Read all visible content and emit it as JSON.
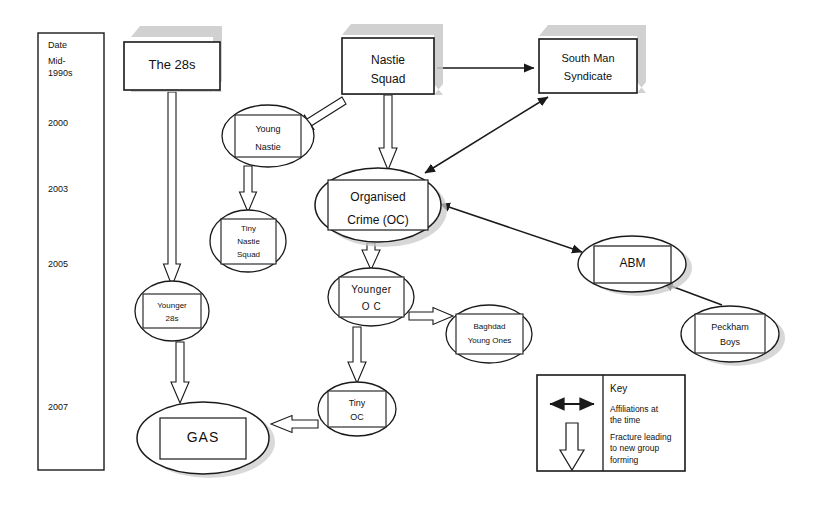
{
  "diagram": {
    "date_axis": {
      "name": "Date",
      "header": "Date",
      "ticks": [
        {
          "label": "Mid-\n1990s",
          "y": 62
        },
        {
          "label": "2000",
          "y": 122
        },
        {
          "label": "2003",
          "y": 188
        },
        {
          "label": "2005",
          "y": 263
        },
        {
          "label": "2007",
          "y": 406
        }
      ]
    },
    "nodes": [
      {
        "id": "the28s",
        "label": "The 28s",
        "shape": "box",
        "shadow": true,
        "cx": 172,
        "cy": 66,
        "w": 96,
        "h": 48,
        "font": 13
      },
      {
        "id": "nastie",
        "label": "Nastie\nSquad",
        "shape": "box",
        "shadow": true,
        "cx": 388,
        "cy": 66,
        "w": 92,
        "h": 56,
        "font": 12
      },
      {
        "id": "southman",
        "label": "South Man\nSyndicate",
        "shape": "box",
        "shadow": true,
        "cx": 588,
        "cy": 66,
        "w": 98,
        "h": 54,
        "font": 11
      },
      {
        "id": "youngnastie",
        "label": "Young\nNastie",
        "shape": "ellipse",
        "shadow": false,
        "cx": 268,
        "cy": 136,
        "w": 92,
        "h": 62,
        "font": 9
      },
      {
        "id": "tinynastie",
        "label": "Tiny\nNastie\nSquad",
        "shape": "ellipse",
        "shadow": false,
        "cx": 248,
        "cy": 241,
        "w": 76,
        "h": 62,
        "font": 8
      },
      {
        "id": "oc",
        "label": "Organised\nCrime (OC)",
        "shape": "ellipse",
        "shadow": true,
        "cx": 378,
        "cy": 205,
        "w": 126,
        "h": 74,
        "font": 12
      },
      {
        "id": "youngeroc",
        "label": "Younger\nO C",
        "shape": "ellipse",
        "shadow": false,
        "cx": 371,
        "cy": 297,
        "w": 86,
        "h": 58,
        "font": 10
      },
      {
        "id": "younger28s",
        "label": "Younger\n28s",
        "shape": "ellipse",
        "shadow": false,
        "cx": 172,
        "cy": 311,
        "w": 74,
        "h": 60,
        "font": 8
      },
      {
        "id": "baghdad",
        "label": "Baghdad\nYoung Ones",
        "shape": "ellipse",
        "shadow": false,
        "cx": 489,
        "cy": 334,
        "w": 86,
        "h": 58,
        "font": 8
      },
      {
        "id": "abm",
        "label": "ABM",
        "shape": "ellipse",
        "shadow": true,
        "cx": 632,
        "cy": 264,
        "w": 108,
        "h": 56,
        "font": 12
      },
      {
        "id": "peckham",
        "label": "Peckham\nBoys",
        "shape": "ellipse",
        "shadow": true,
        "cx": 730,
        "cy": 334,
        "w": 98,
        "h": 56,
        "font": 9
      },
      {
        "id": "tinyoc",
        "label": "Tiny\nOC",
        "shape": "ellipse",
        "shadow": false,
        "cx": 357,
        "cy": 409,
        "w": 78,
        "h": 54,
        "font": 9
      },
      {
        "id": "gas",
        "label": "GAS",
        "shape": "ellipse",
        "shadow": true,
        "cx": 203,
        "cy": 438,
        "w": 132,
        "h": 72,
        "font": 14
      }
    ],
    "fracture_edges": [
      {
        "from": "the28s",
        "to": "younger28s",
        "note": "The 28s fractures to Younger 28s"
      },
      {
        "from": "nastie",
        "to": "youngnastie",
        "note": "Nastie Squad fractures to Young Nastie"
      },
      {
        "from": "nastie",
        "to": "oc",
        "note": "Nastie Squad fractures to Organised Crime"
      },
      {
        "from": "youngnastie",
        "to": "tinynastie",
        "note": "Young Nastie fractures to Tiny Nastie Squad"
      },
      {
        "from": "oc",
        "to": "youngeroc",
        "note": "Organised Crime fractures to Younger OC"
      },
      {
        "from": "youngeroc",
        "to": "tinyoc",
        "note": "Younger OC fractures to Tiny OC"
      },
      {
        "from": "youngeroc",
        "to": "baghdad",
        "note": "Younger OC fractures to Baghdad Young Ones"
      },
      {
        "from": "younger28s",
        "to": "gas",
        "note": "Younger 28s fractures to GAS"
      },
      {
        "from": "tinyoc",
        "to": "gas",
        "note": "Tiny OC fractures to GAS"
      }
    ],
    "affiliation_edges": [
      {
        "from": "nastie",
        "to": "southman",
        "double": false,
        "note": "Nastie Squad affiliated with South Man Syndicate"
      },
      {
        "from": "oc",
        "to": "southman",
        "double": true,
        "note": "Organised Crime affiliated with South Man Syndicate"
      },
      {
        "from": "oc",
        "to": "abm",
        "double": true,
        "note": "Organised Crime affiliated with ABM"
      },
      {
        "from": "peckham",
        "to": "abm",
        "double": false,
        "note": "Peckham Boys affiliated with ABM"
      }
    ],
    "key": {
      "title": "Key",
      "affiliation_text": "Affiliations at\nthe time",
      "fracture_text": "Fracture leading\nto new group\nforming"
    },
    "colors": {
      "stroke": "#1a1a1a",
      "shadow": "#c9c9c9",
      "background": "#ffffff",
      "text": "#111111"
    }
  }
}
